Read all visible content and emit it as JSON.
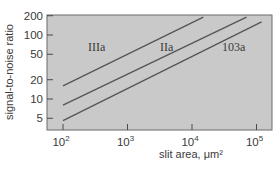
{
  "chart_data": {
    "type": "line",
    "title": "",
    "xlabel": "slit area, μm²",
    "ylabel": "signal-to-noise ratio",
    "xscale": "log",
    "yscale": "log",
    "xlim": [
      75,
      150000
    ],
    "ylim": [
      3.6,
      200
    ],
    "x_ticks": [
      100,
      1000,
      10000,
      100000
    ],
    "x_tick_labels": [
      "10",
      "10",
      "10",
      "10"
    ],
    "x_tick_exponents": [
      "2",
      "3",
      "4",
      "5"
    ],
    "y_ticks": [
      5,
      10,
      20,
      50,
      100,
      200
    ],
    "y_tick_labels": [
      "5",
      "10",
      "20",
      "50",
      "100",
      "200"
    ],
    "grid": false,
    "legend": "inline labels",
    "series": [
      {
        "name": "IIIa",
        "x": [
          100,
          15000
        ],
        "y": [
          16,
          190
        ]
      },
      {
        "name": "IIa",
        "x": [
          100,
          70000
        ],
        "y": [
          8,
          190
        ]
      },
      {
        "name": "103a",
        "x": [
          100,
          120000
        ],
        "y": [
          4.6,
          160
        ]
      }
    ],
    "colors": {
      "plot_bg": "#c9c9c9",
      "line": "#555555",
      "axis": "#4a4a4a"
    }
  }
}
